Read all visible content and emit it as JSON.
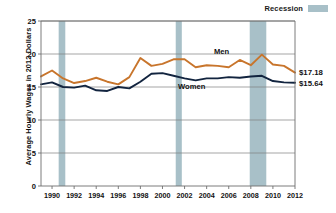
{
  "legend": {
    "label": "Recession",
    "swatch_color": "#a8c0c8",
    "position": "top-right"
  },
  "axis": {
    "ylabel": "Average Hourly Wages in 2012 Dollars",
    "xlabel": ""
  },
  "annotations": {
    "men_label": "Men",
    "women_label": "Women",
    "men_end_value": "$17.18",
    "women_end_value": "$15.64"
  },
  "chart_data": {
    "type": "line",
    "title": "",
    "subtitle": "",
    "xlabel": "",
    "ylabel": "Average Hourly Wages in 2012 Dollars",
    "xlim": [
      1989,
      2012
    ],
    "ylim": [
      0,
      25
    ],
    "yticks": [
      0,
      5,
      10,
      15,
      20,
      25
    ],
    "xticks": [
      1990,
      1992,
      1994,
      1996,
      1998,
      2000,
      2002,
      2004,
      2006,
      2008,
      2010,
      2012
    ],
    "grid": true,
    "grid_axis": "y",
    "legend_position": "top-right",
    "x": [
      1989,
      1990,
      1991,
      1992,
      1993,
      1994,
      1995,
      1996,
      1997,
      1998,
      1999,
      2000,
      2001,
      2002,
      2003,
      2004,
      2005,
      2006,
      2007,
      2008,
      2009,
      2010,
      2011,
      2012
    ],
    "series": [
      {
        "name": "Men",
        "color": "#c8752c",
        "end_label": "$17.18",
        "values": [
          16.6,
          17.5,
          16.3,
          15.6,
          15.9,
          16.4,
          15.8,
          15.4,
          16.5,
          19.4,
          18.2,
          18.5,
          19.2,
          19.2,
          18.0,
          18.3,
          18.2,
          18.0,
          19.1,
          18.3,
          19.9,
          18.4,
          18.2,
          17.18
        ]
      },
      {
        "name": "Women",
        "color": "#12243f",
        "end_label": "$15.64",
        "values": [
          15.4,
          15.7,
          15.0,
          14.9,
          15.2,
          14.5,
          14.4,
          15.0,
          14.8,
          15.8,
          17.0,
          17.1,
          16.7,
          16.3,
          16.0,
          16.3,
          16.3,
          16.5,
          16.4,
          16.6,
          16.7,
          15.9,
          15.7,
          15.64
        ]
      }
    ],
    "recession_bands": [
      {
        "start": 1990.6,
        "end": 1991.2
      },
      {
        "start": 2001.2,
        "end": 2001.75
      },
      {
        "start": 2007.9,
        "end": 2009.4
      }
    ]
  }
}
